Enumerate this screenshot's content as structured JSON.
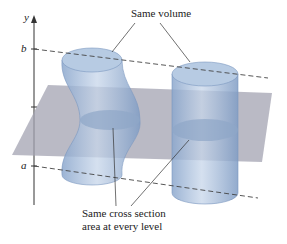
{
  "diagram": {
    "axis_label": "y",
    "level_top": "b",
    "level_bottom": "a",
    "annotation_top": "Same volume",
    "annotation_bottom_line1": "Same cross section",
    "annotation_bottom_line2": "area at every level"
  },
  "colors": {
    "solid_fill": "#9fb8d8",
    "solid_edge": "#6f8fb8",
    "plane": "#9a9aa8",
    "axis": "#333333"
  }
}
